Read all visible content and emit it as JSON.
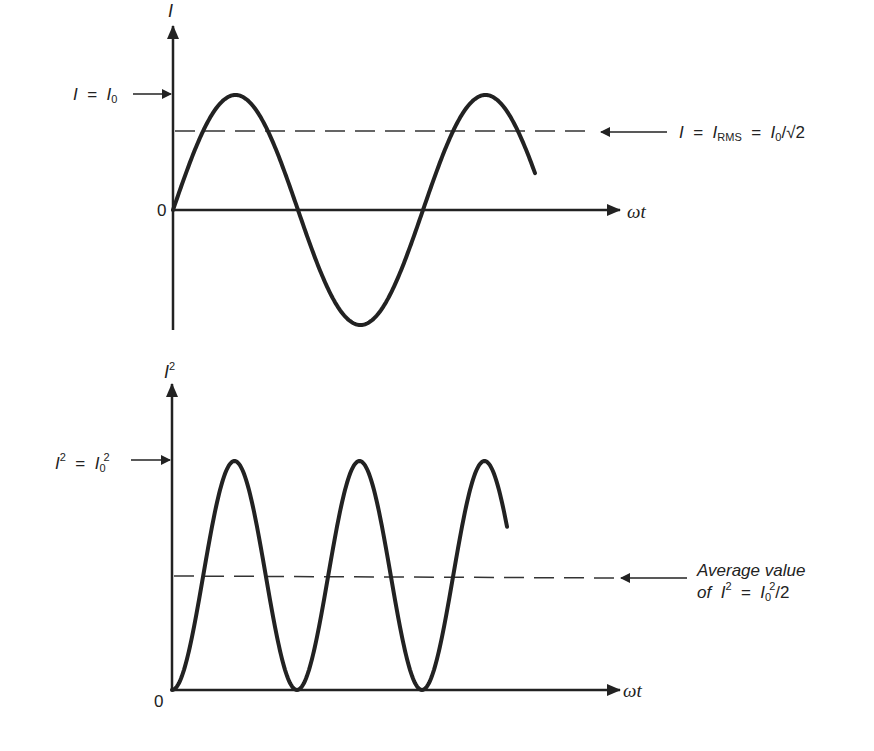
{
  "top_plot": {
    "y_axis_label": "I",
    "x_axis_label": "ωt",
    "origin_label": "0",
    "peak_label": {
      "lhs": "I",
      "eq": "=",
      "rhs": "I",
      "rhs_sub": "0"
    },
    "rms_label": {
      "lhs": "I",
      "eq1": "=",
      "mid": "I",
      "mid_sub": "RMS",
      "eq2": "=",
      "rhs": "I",
      "rhs_sub": "0",
      "rhs_tail": "/√2"
    }
  },
  "bottom_plot": {
    "y_axis_label": "I",
    "y_axis_sup": "2",
    "x_axis_label": "ωt",
    "origin_label": "0",
    "peak_label": {
      "lhs": "I",
      "lhs_sup": "2",
      "eq": "=",
      "rhs": "I",
      "rhs_sub": "0",
      "rhs_sup": "2"
    },
    "avg_label": {
      "line1": "Average value",
      "line2_pre": "of",
      "lhs": "I",
      "lhs_sup": "2",
      "eq": "=",
      "rhs": "I",
      "rhs_sub": "0",
      "rhs_sup": "2",
      "rhs_tail": "/2"
    }
  },
  "colors": {
    "ink": "#222222",
    "background": "#ffffff"
  }
}
